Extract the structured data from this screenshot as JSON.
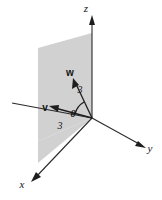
{
  "figure": {
    "background_color": "#ffffff",
    "plane": {
      "name": "shaded-plane",
      "fill_color": "#c9c9c9",
      "opacity": 0.85
    },
    "axes": [
      {
        "id": "z",
        "label": "z",
        "direction": "up",
        "label_x": 86,
        "label_y": 12
      },
      {
        "id": "y",
        "label": "y",
        "direction": "right-down",
        "label_x": 150,
        "label_y": 152
      },
      {
        "id": "x",
        "label": "x",
        "direction": "left-down",
        "label_x": 22,
        "label_y": 188
      }
    ],
    "vectors": [
      {
        "id": "w",
        "label": "w",
        "magnitude": "3",
        "label_x": 70,
        "label_y": 76,
        "mag_x": 80,
        "mag_y": 93,
        "color": "#1e1e1e"
      },
      {
        "id": "v",
        "label": "v",
        "magnitude": "3",
        "label_x": 45,
        "label_y": 111,
        "mag_x": 60,
        "mag_y": 129,
        "color": "#1e1e1e"
      }
    ],
    "angle": {
      "id": "theta",
      "label": "θ",
      "label_x": 73,
      "label_y": 117
    }
  }
}
